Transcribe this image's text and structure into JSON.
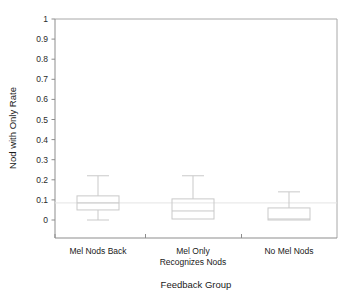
{
  "chart_data": {
    "type": "box",
    "title": "",
    "xlabel": "Feedback Group",
    "ylabel": "Nod with Only Rate",
    "categories": [
      "Mel Nods Back",
      "Mel Only Recognizes Nods",
      "No Mel Nods"
    ],
    "category_lines": [
      [
        "Mel Nods Back"
      ],
      [
        "Mel Only",
        "Recognizes Nods"
      ],
      [
        "No Mel Nods"
      ]
    ],
    "ylim": [
      0,
      1
    ],
    "ytick_values": [
      0,
      0.1,
      0.2,
      0.3,
      0.4,
      0.5,
      0.6,
      0.7,
      0.8,
      0.9,
      1
    ],
    "ytick_labels": [
      "0",
      "0.1",
      "0.2",
      "0.3",
      "0.4",
      "0.5",
      "0.6",
      "0.7",
      "0.8",
      "0.9",
      "1"
    ],
    "grid": false,
    "legend": "none",
    "series": [
      {
        "name": "Mel Nods Back",
        "whisker_low": 0.0,
        "q1": 0.05,
        "median": 0.085,
        "q3": 0.12,
        "whisker_high": 0.22
      },
      {
        "name": "Mel Only Recognizes Nods",
        "whisker_low": 0.005,
        "q1": 0.005,
        "median": 0.045,
        "q3": 0.105,
        "whisker_high": 0.22
      },
      {
        "name": "No Mel Nods",
        "whisker_low": 0.0,
        "q1": 0.0,
        "median": 0.005,
        "q3": 0.06,
        "whisker_high": 0.14
      }
    ]
  },
  "style": {
    "axis_color": "#999999",
    "box_color": "#c9c9c9",
    "plot_background": "#ffffff"
  }
}
